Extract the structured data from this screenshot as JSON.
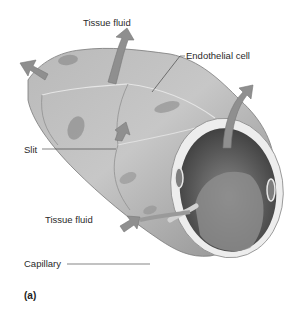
{
  "figure": {
    "panel_label": "(a)",
    "labels": {
      "tissue_fluid_top": "Tissue fluid",
      "endothelial_cell": "Endothelial cell",
      "slit": "Slit",
      "tissue_fluid_bottom": "Tissue fluid",
      "capillary": "Capillary"
    },
    "colors": {
      "background": "#ffffff",
      "wall_light": "#c4c4c4",
      "wall_mid": "#a9a9a9",
      "wall_dark": "#8a8a8a",
      "lumen_dark": "#4a4a4a",
      "nucleus": "#7d7d7d",
      "arrow": "#8f8f8f",
      "rim": "#ececec",
      "leader_line": "#333333"
    }
  }
}
